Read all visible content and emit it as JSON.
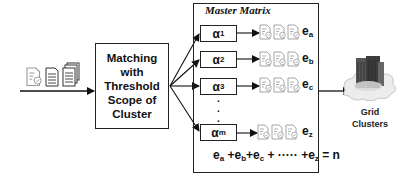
{
  "diagram": {
    "input": {
      "icons": [
        "document-with-badge-icon",
        "document-lines-icon",
        "document-stack-icon"
      ]
    },
    "matching_box": {
      "lines": [
        "Matching",
        "with",
        "Threshold",
        "Scope of",
        "Cluster"
      ]
    },
    "master_matrix": {
      "title": "Master Matrix",
      "rows": [
        {
          "alpha": "α",
          "alpha_sub": "1",
          "docs": 3,
          "e": "e",
          "e_sub": "a"
        },
        {
          "alpha": "α",
          "alpha_sub": "2",
          "docs": 3,
          "e": "e",
          "e_sub": "b"
        },
        {
          "alpha": "α",
          "alpha_sub": "3",
          "docs": 3,
          "e": "e",
          "e_sub": "c"
        },
        {
          "alpha": "α",
          "alpha_sub": "m",
          "docs": 3,
          "e": "e",
          "e_sub": "z"
        }
      ],
      "ellipsis": "·",
      "equation": {
        "parts": [
          "e",
          "a",
          " +e",
          "b",
          "+e",
          "c",
          " + ····· +e",
          "z",
          " = n"
        ]
      }
    },
    "output": {
      "icon": "server-cloud-icon",
      "label_line1": "Grid",
      "label_line2": "Clusters"
    },
    "colors": {
      "stroke": "#222222",
      "doc_gray": "#9a9a9a",
      "server_dark": "#4a4a4a",
      "cloud": "#e6e6e6"
    }
  }
}
